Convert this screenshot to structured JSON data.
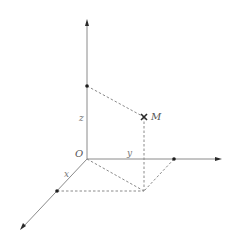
{
  "diagram": {
    "type": "3d-coordinate-system",
    "labels": {
      "origin": "O",
      "point": "M",
      "x_axis": "x",
      "y_axis": "y",
      "z_axis": "z"
    },
    "colors": {
      "axis": "#8a8a8a",
      "dashed": "#8a8a8a",
      "points": "#1e1e1e",
      "text": "#555555"
    }
  }
}
